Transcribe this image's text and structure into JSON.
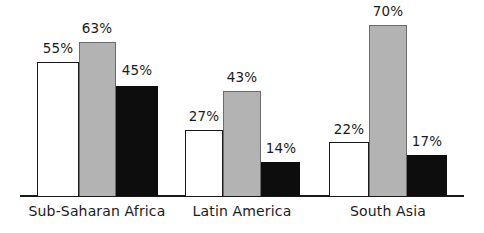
{
  "chart_data": {
    "type": "bar",
    "title": "",
    "subtitle": "",
    "xlabel": "",
    "ylabel": "",
    "ylim": [
      0,
      80
    ],
    "grid": false,
    "legend": "none",
    "categories": [
      "Sub-Saharan Africa",
      "Latin America",
      "South Asia"
    ],
    "series": [
      {
        "name": "series-1",
        "color": "#ffffff",
        "values": [
          55,
          27,
          22
        ],
        "value_labels": [
          "55%",
          "27%",
          "22%"
        ]
      },
      {
        "name": "series-2",
        "color": "#b3b3b3",
        "values": [
          63,
          43,
          70
        ],
        "value_labels": [
          "63%",
          "43%",
          "70%"
        ]
      },
      {
        "name": "series-3",
        "color": "#0d0d0d",
        "values": [
          45,
          14,
          17
        ],
        "value_labels": [
          "45%",
          "14%",
          "17%"
        ]
      }
    ]
  },
  "colors": {
    "series_white": "#ffffff",
    "series_gray": "#b3b3b3",
    "series_black": "#0d0d0d",
    "axis": "#1a1a1a",
    "text": "#1a1a1a",
    "background": "#ffffff"
  },
  "groups": [
    {
      "label": "Sub-Saharan Africa",
      "label_center": 97,
      "bars": [
        {
          "series": "series-white",
          "value": 55,
          "label": "55%",
          "x": 37,
          "width": 42,
          "label_center": 58,
          "label_top": 42
        },
        {
          "series": "series-gray",
          "value": 63,
          "label": "63%",
          "x": 79,
          "width": 37,
          "label_center": 97,
          "label_top": 22
        },
        {
          "series": "series-black",
          "value": 45,
          "label": "45%",
          "x": 116,
          "width": 42,
          "label_center": 137,
          "label_top": 64
        }
      ]
    },
    {
      "label": "Latin America",
      "label_center": 242,
      "bars": [
        {
          "series": "series-white",
          "value": 27,
          "label": "27%",
          "x": 185,
          "width": 38,
          "label_center": 204,
          "label_top": 110
        },
        {
          "series": "series-gray",
          "value": 43,
          "label": "43%",
          "x": 223,
          "width": 38,
          "label_center": 242,
          "label_top": 71
        },
        {
          "series": "series-black",
          "value": 14,
          "label": "14%",
          "x": 261,
          "width": 39,
          "label_center": 281,
          "label_top": 142
        }
      ]
    },
    {
      "label": "South Asia",
      "label_center": 388,
      "bars": [
        {
          "series": "series-white",
          "value": 22,
          "label": "22%",
          "x": 329,
          "width": 40,
          "label_center": 349,
          "label_top": 123
        },
        {
          "series": "series-gray",
          "value": 70,
          "label": "70%",
          "x": 369,
          "width": 38,
          "label_center": 388,
          "label_top": 5
        },
        {
          "series": "series-black",
          "value": 17,
          "label": "17%",
          "x": 407,
          "width": 40,
          "label_center": 427,
          "label_top": 135
        }
      ]
    }
  ],
  "axis": {
    "baseline_y": 195,
    "left_x": 20,
    "width": 444,
    "px_per_percent": 2.44
  }
}
